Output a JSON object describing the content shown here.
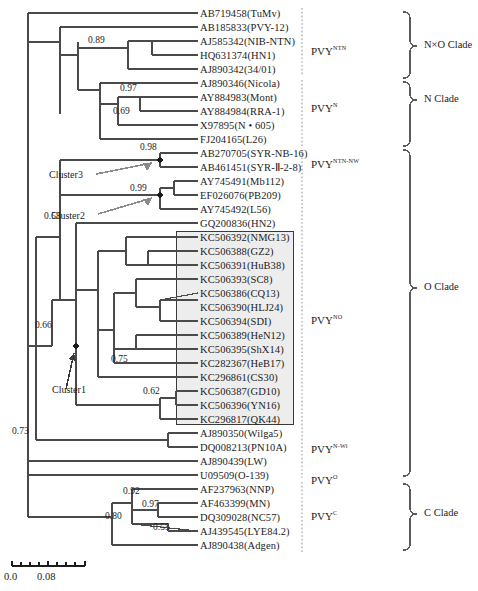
{
  "figure": {
    "type": "phylogenetic-tree",
    "taxa": [
      {
        "id": "t0",
        "label": "AB719458(TuMv)",
        "y": 13
      },
      {
        "id": "t1",
        "label": "AB185833(PVY-12)",
        "y": 27
      },
      {
        "id": "t2",
        "label": "AJ585342(NIB-NTN)",
        "y": 41
      },
      {
        "id": "t3",
        "label": "HQ631374(HN1)",
        "y": 55
      },
      {
        "id": "t4",
        "label": "AJ890342(34/01)",
        "y": 69
      },
      {
        "id": "t5",
        "label": "AJ890346(Nicola)",
        "y": 83
      },
      {
        "id": "t6",
        "label": "AY884983(Mont)",
        "y": 97
      },
      {
        "id": "t7",
        "label": "AY884984(RRA-1)",
        "y": 111
      },
      {
        "id": "t8",
        "label": "X97895(N • 605)",
        "y": 125
      },
      {
        "id": "t9",
        "label": "FJ204165(L26)",
        "y": 139
      },
      {
        "id": "t10",
        "label": "AB270705(SYR-NB-16)",
        "y": 153
      },
      {
        "id": "t11",
        "label": "AB461451(SYR-Ⅱ-2-8)",
        "y": 167
      },
      {
        "id": "t12",
        "label": "AY745491(Mb112)",
        "y": 181
      },
      {
        "id": "t13",
        "label": "EF026076(PB209)",
        "y": 195
      },
      {
        "id": "t14",
        "label": "AY745492(L56)",
        "y": 209
      },
      {
        "id": "t15",
        "label": "GQ200836(HN2)",
        "y": 223
      },
      {
        "id": "t16",
        "label": "KC506392(NMG13)",
        "y": 237
      },
      {
        "id": "t17",
        "label": "KC506388(GZ2)",
        "y": 251
      },
      {
        "id": "t18",
        "label": "KC506391(HuB38)",
        "y": 265
      },
      {
        "id": "t19",
        "label": "KC506393(SC8)",
        "y": 279
      },
      {
        "id": "t20",
        "label": "KC506386(CQ13)",
        "y": 293
      },
      {
        "id": "t21",
        "label": "KC506390(HLJ24)",
        "y": 307
      },
      {
        "id": "t22",
        "label": "KC506394(SDI)",
        "y": 321
      },
      {
        "id": "t23",
        "label": "KC506389(HeN12)",
        "y": 335
      },
      {
        "id": "t24",
        "label": "KC506395(ShX14)",
        "y": 349
      },
      {
        "id": "t25",
        "label": "KC282367(HeB17)",
        "y": 363
      },
      {
        "id": "t26",
        "label": "KC296861(CS30)",
        "y": 377
      },
      {
        "id": "t27",
        "label": "KC506387(GD10)",
        "y": 391
      },
      {
        "id": "t28",
        "label": "KC506396(YN16)",
        "y": 405
      },
      {
        "id": "t29",
        "label": "KC296817(QK44)",
        "y": 419
      },
      {
        "id": "t30",
        "label": "AJ890350(Wilga5)",
        "y": 433
      },
      {
        "id": "t31",
        "label": "DQ008213(PN10A)",
        "y": 447
      },
      {
        "id": "t32",
        "label": "AJ890439(LW)",
        "y": 461
      },
      {
        "id": "t33",
        "label": "U09509(O-139)",
        "y": 475
      },
      {
        "id": "t34",
        "label": "AF237963(NNP)",
        "y": 489
      },
      {
        "id": "t35",
        "label": "AF463399(MN)",
        "y": 503
      },
      {
        "id": "t36",
        "label": "DQ309028(NC57)",
        "y": 517
      },
      {
        "id": "t37",
        "label": "AJ439545(LYE84.2)",
        "y": 531
      },
      {
        "id": "t38",
        "label": "AJ890438(Adgen)",
        "y": 545
      }
    ],
    "bootstrap_values": [
      {
        "id": "b1",
        "value": "0.89",
        "x": 88,
        "y": 42
      },
      {
        "id": "b2",
        "value": "0.97",
        "x": 120,
        "y": 90
      },
      {
        "id": "b3",
        "value": "0.69",
        "x": 113,
        "y": 113
      },
      {
        "id": "b4",
        "value": "0.98",
        "x": 140,
        "y": 149
      },
      {
        "id": "b5",
        "value": "0.99",
        "x": 130,
        "y": 190
      },
      {
        "id": "b6",
        "value": "0.58",
        "x": 44,
        "y": 218
      },
      {
        "id": "b7",
        "value": "0.66",
        "x": 35,
        "y": 327
      },
      {
        "id": "b8",
        "value": "0.75",
        "x": 111,
        "y": 361
      },
      {
        "id": "b9",
        "value": "0.62",
        "x": 143,
        "y": 393
      },
      {
        "id": "b10",
        "value": "0.73",
        "x": 12,
        "y": 433
      },
      {
        "id": "b11",
        "value": "0.92",
        "x": 123,
        "y": 493
      },
      {
        "id": "b12",
        "value": "0.97",
        "x": 142,
        "y": 506
      },
      {
        "id": "b13",
        "value": "0.80",
        "x": 105,
        "y": 518
      },
      {
        "id": "b14",
        "value": "0.55",
        "x": 153,
        "y": 529
      }
    ],
    "cluster_labels": [
      {
        "id": "c3",
        "label": "Cluster3",
        "x": 49,
        "y": 176
      },
      {
        "id": "c2",
        "label": "Cluster2",
        "x": 51,
        "y": 217
      },
      {
        "id": "c1",
        "label": "Cluster1",
        "x": 52,
        "y": 391
      }
    ],
    "strain_groups": [
      {
        "id": "g1",
        "base": "PVY",
        "sup": "NTN",
        "x": 311,
        "y": 48
      },
      {
        "id": "g2",
        "base": "PVY",
        "sup": "N",
        "x": 311,
        "y": 105
      },
      {
        "id": "g3",
        "base": "PVY",
        "sup": "NTN-NW",
        "x": 311,
        "y": 161
      },
      {
        "id": "g4",
        "base": "PVY",
        "sup": "NO",
        "x": 311,
        "y": 317
      },
      {
        "id": "g5",
        "base": "PVY",
        "sup": "N-Wi",
        "x": 311,
        "y": 446
      },
      {
        "id": "g6",
        "base": "PVY",
        "sup": "O",
        "x": 311,
        "y": 477
      },
      {
        "id": "g7",
        "base": "PVY",
        "sup": "C",
        "x": 311,
        "y": 513
      }
    ],
    "clades": [
      {
        "id": "cl1",
        "label": "N×O Clade",
        "x": 424,
        "y": 45,
        "top": 10,
        "bottom": 78
      },
      {
        "id": "cl2",
        "label": "N Clade",
        "x": 424,
        "y": 99,
        "top": 80,
        "bottom": 146
      },
      {
        "id": "cl3",
        "label": "O Clade",
        "x": 424,
        "y": 287,
        "top": 148,
        "bottom": 478
      },
      {
        "id": "cl4",
        "label": "C Clade",
        "x": 424,
        "y": 513,
        "top": 482,
        "bottom": 552
      }
    ],
    "scale_bar": {
      "left_label": "0.0",
      "right_label": "0.08",
      "ticks": 9
    }
  }
}
